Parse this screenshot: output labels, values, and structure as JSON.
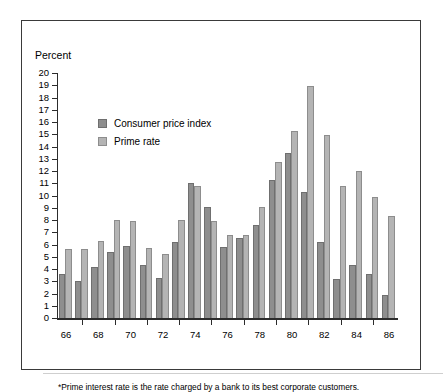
{
  "chart_data": {
    "type": "bar",
    "title": "",
    "xlabel": "",
    "ylabel": "Percent",
    "ylim": [
      0,
      20
    ],
    "ytick_step": 1,
    "grid": false,
    "legend_position": "upper-left-inside",
    "axis_title": "Percent",
    "categories": [
      "66",
      "67",
      "68",
      "69",
      "70",
      "71",
      "72",
      "73",
      "74",
      "75",
      "76",
      "77",
      "78",
      "79",
      "80",
      "81",
      "82",
      "83",
      "84",
      "85",
      "86"
    ],
    "xtick_labels": [
      "66",
      "68",
      "70",
      "72",
      "74",
      "76",
      "78",
      "80",
      "82",
      "84",
      "86"
    ],
    "series": [
      {
        "name": "Consumer price index",
        "color": "#8e8e8e",
        "values": [
          3.6,
          3.0,
          4.2,
          5.4,
          5.9,
          4.3,
          3.3,
          6.2,
          11.0,
          9.1,
          5.8,
          6.5,
          7.6,
          11.3,
          13.5,
          10.3,
          6.2,
          3.2,
          4.3,
          3.6,
          1.9
        ]
      },
      {
        "name": "Prime rate",
        "color": "#b4b4b4",
        "values": [
          5.6,
          5.6,
          6.3,
          8.0,
          7.9,
          5.7,
          5.2,
          8.0,
          10.8,
          7.9,
          6.8,
          6.8,
          9.1,
          12.7,
          15.3,
          18.9,
          14.9,
          10.8,
          12.0,
          9.9,
          8.3
        ]
      }
    ],
    "notes": "*Prime interest rate is the rate charged by a bank to its best corporate customers."
  },
  "axis": {
    "y_title": "Percent",
    "y_labels": [
      "20",
      "19",
      "18",
      "17",
      "16",
      "15",
      "14",
      "13",
      "12",
      "11",
      "10",
      "9",
      "8",
      "7",
      "6",
      "5",
      "4",
      "3",
      "2",
      "1",
      "0"
    ]
  },
  "legend": {
    "items": [
      {
        "label": "Consumer price index",
        "key": "cpi"
      },
      {
        "label": "Prime rate",
        "key": "prime"
      }
    ]
  },
  "footnote": {
    "text": "*Prime interest rate is the rate charged by a bank to its best corporate customers."
  }
}
